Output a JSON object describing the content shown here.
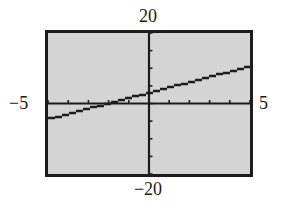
{
  "window": {
    "xmin_label": "−5",
    "xmax_label": "5",
    "ymax_label": "20",
    "ymin_label": "−20"
  },
  "colors": {
    "screen_bg": "#d4d4d4",
    "axis": "#1c1c1c",
    "line": "#1c1c1c",
    "frame": "#1c1c1c"
  },
  "chart_data": {
    "type": "line",
    "title": "",
    "xlabel": "",
    "ylabel": "",
    "xlim": [
      -5,
      5
    ],
    "ylim": [
      -20,
      20
    ],
    "xscl": 1,
    "yscl": 5,
    "grid": false,
    "legend": null,
    "series": [
      {
        "name": "y = 1.5x + 3",
        "x": [
          -5,
          -4,
          -3,
          -2,
          -1,
          0,
          1,
          2,
          3,
          4,
          5
        ],
        "y": [
          -4.5,
          -3,
          -1.5,
          0,
          1.5,
          3,
          4.5,
          6,
          7.5,
          9,
          10.5
        ]
      }
    ],
    "tick_labels": {
      "x_left": "−5",
      "x_right": "5",
      "y_top": "20",
      "y_bottom": "−20"
    }
  }
}
